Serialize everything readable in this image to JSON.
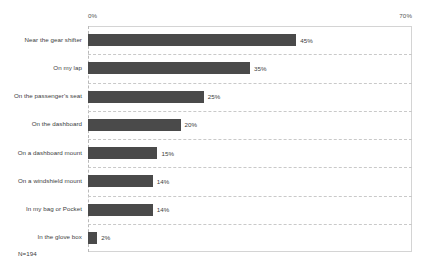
{
  "chart_data": {
    "type": "bar",
    "orientation": "horizontal",
    "title": "",
    "subtitle": "",
    "xlabel": "",
    "ylabel": "",
    "xlim": [
      0,
      70
    ],
    "grid": true,
    "legend": null,
    "categories": [
      "Near the gear shifter",
      "On my lap",
      "On the passenger's seat",
      "On the dashboard",
      "On a dashboard mount",
      "On a windshield mount",
      "In my bag or Pocket",
      "In the glove box"
    ],
    "values": [
      45,
      35,
      25,
      20,
      15,
      14,
      14,
      2
    ],
    "value_labels": [
      "45%",
      "35%",
      "25%",
      "20%",
      "15%",
      "14%",
      "14%",
      "2%"
    ],
    "tick_labels": [
      "0%",
      "70%"
    ],
    "tick_values": [
      0,
      70
    ],
    "annotation": "N=194",
    "bar_color": "#4a4a4a",
    "gridline_color": "#c9c9c9",
    "axis_color": "#d4d4d4",
    "background": "#ffffff"
  }
}
